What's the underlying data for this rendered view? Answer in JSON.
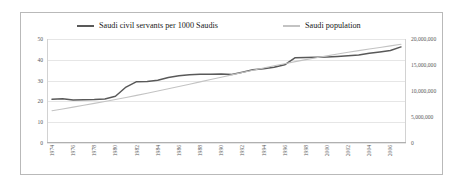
{
  "chart_data": {
    "type": "line",
    "title": "",
    "xlabel": "",
    "ylabel": "",
    "grid": true,
    "legend_position": "top",
    "x": [
      1974,
      1975,
      1976,
      1977,
      1978,
      1979,
      1980,
      1981,
      1982,
      1983,
      1984,
      1985,
      1986,
      1987,
      1988,
      1989,
      1990,
      1991,
      1992,
      1993,
      1994,
      1995,
      1996,
      1997,
      1998,
      1999,
      2000,
      2001,
      2002,
      2003,
      2004,
      2005,
      2006,
      2007
    ],
    "xtick_labels": [
      "1974",
      "1976",
      "1978",
      "1980",
      "1982",
      "1984",
      "1986",
      "1988",
      "1990",
      "1992",
      "1994",
      "1996",
      "1998",
      "2000",
      "2002",
      "2004",
      "2006"
    ],
    "axes": {
      "left": {
        "label": "",
        "min": 0,
        "max": 50,
        "step": 10,
        "ticks": [
          "0",
          "10",
          "20",
          "30",
          "40",
          "50"
        ]
      },
      "right": {
        "label": "",
        "min": 0,
        "max": 20000000,
        "step": 5000000,
        "ticks": [
          "0",
          "5,000,000",
          "10,000,000",
          "15,000,000",
          "20,000,000"
        ]
      }
    },
    "series": [
      {
        "name": "Saudi civil servants per 1000 Saudis",
        "axis": "left",
        "color": "#595959",
        "values": [
          21.0,
          21.3,
          20.7,
          20.8,
          20.9,
          21.2,
          22.5,
          26.9,
          29.5,
          29.6,
          30.2,
          31.5,
          32.3,
          32.8,
          33.0,
          33.1,
          33.2,
          32.9,
          34.0,
          35.2,
          35.7,
          36.4,
          37.6,
          41.0,
          41.1,
          41.2,
          41.4,
          41.6,
          41.9,
          42.3,
          43.1,
          43.8,
          44.5,
          46.2
        ]
      },
      {
        "name": "Saudi population",
        "axis": "right",
        "color": "#c3c3c3",
        "values": [
          6200000,
          6550000,
          6900000,
          7260000,
          7620000,
          7990000,
          8370000,
          8760000,
          9160000,
          9570000,
          9990000,
          10420000,
          10860000,
          11300000,
          11750000,
          12200000,
          12650000,
          13100000,
          13550000,
          14000000,
          14430000,
          14850000,
          15250000,
          15650000,
          16030000,
          16400000,
          16760000,
          17110000,
          17450000,
          17770000,
          18080000,
          18380000,
          18680000,
          18980000
        ]
      }
    ]
  },
  "legend": {
    "items": [
      {
        "label": "Saudi civil servants per 1000 Saudis",
        "color": "#595959"
      },
      {
        "label": "Saudi population",
        "color": "#c3c3c3"
      }
    ]
  }
}
